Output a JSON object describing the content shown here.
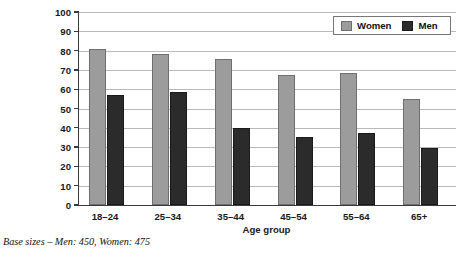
{
  "chart_data": {
    "type": "bar",
    "title": "",
    "xlabel": "Age group",
    "ylabel": "Percentage answering 'Yes' to question",
    "categories": [
      "18–24",
      "25–34",
      "35–44",
      "45–54",
      "55–64",
      "65+"
    ],
    "series": [
      {
        "name": "Women",
        "color": "#9c9c9c",
        "values": [
          81,
          78.5,
          75.5,
          67.5,
          68.5,
          55
        ]
      },
      {
        "name": "Men",
        "color": "#2b2b2b",
        "values": [
          57,
          58.5,
          40,
          35.5,
          37.5,
          29.5
        ]
      }
    ],
    "ylim": [
      0,
      100
    ],
    "yticks": [
      0,
      10,
      20,
      30,
      40,
      50,
      60,
      70,
      80,
      90,
      100
    ],
    "ytick_labels": [
      "0",
      "10",
      "20",
      "30",
      "40",
      "50",
      "60",
      "70",
      "80",
      "90",
      "100"
    ],
    "grid": true,
    "legend_position": "top-right",
    "legend_entries": [
      "Women",
      "Men"
    ]
  },
  "footnote": "Base sizes – Men: 450, Women: 475"
}
